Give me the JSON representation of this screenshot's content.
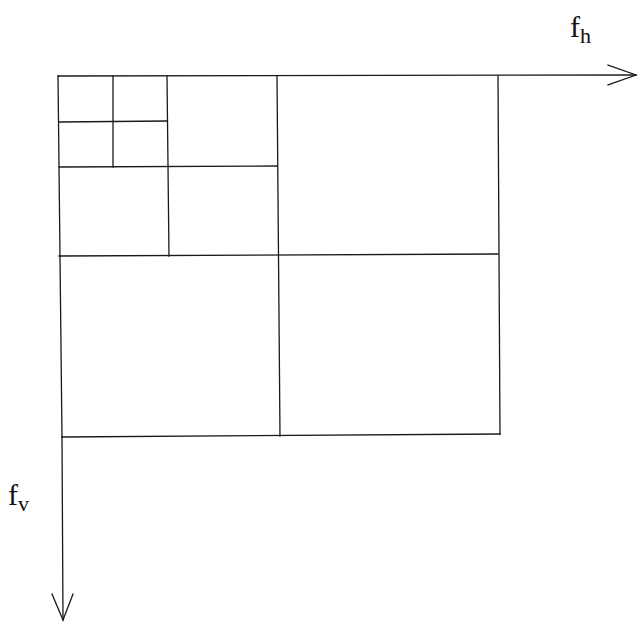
{
  "diagram": {
    "title": "",
    "axes": {
      "horizontal": {
        "symbol": "f",
        "subscript": "h"
      },
      "vertical": {
        "symbol": "f",
        "subscript": "v"
      }
    },
    "decomposition_levels": 3,
    "line_color": "#1a1a1a",
    "background_color": "#ffffff"
  }
}
